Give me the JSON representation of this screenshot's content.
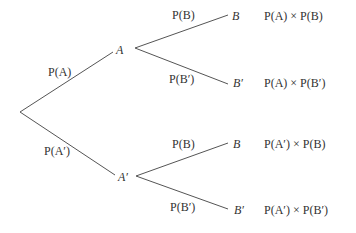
{
  "colors": {
    "line": "#555555",
    "text": "#333333",
    "background": "#ffffff"
  },
  "first_stage": {
    "upper": {
      "node": "A",
      "branch_label": "P(A)"
    },
    "lower": {
      "node": "A′",
      "branch_label": "P(A′)"
    }
  },
  "second_stage": {
    "after_A": {
      "upper": {
        "node": "B",
        "branch_label": "P(B)",
        "product": "P(A) × P(B)"
      },
      "lower": {
        "node": "B′",
        "branch_label": "P(B′)",
        "product": "P(A) × P(B′)"
      }
    },
    "after_A_prime": {
      "upper": {
        "node": "B",
        "branch_label": "P(B)",
        "product": "P(A′) × P(B)"
      },
      "lower": {
        "node": "B′",
        "branch_label": "P(B′)",
        "product": "P(A′) × P(B′)"
      }
    }
  }
}
